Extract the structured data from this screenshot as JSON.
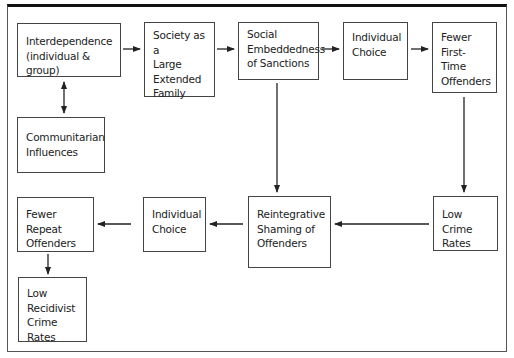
{
  "diagram": {
    "nodes": [
      {
        "id": "interdependence",
        "label": "Interdependence\n(individual & group)"
      },
      {
        "id": "society",
        "label": "Society as a\nLarge\nExtended\nFamily"
      },
      {
        "id": "social_embeddedness",
        "label": "Social\nEmbeddedness\nof Sanctions"
      },
      {
        "id": "individual_choice_top",
        "label": "Individual\nChoice"
      },
      {
        "id": "fewer_first_time",
        "label": "Fewer\nFirst-Time\nOffenders"
      },
      {
        "id": "communitarian",
        "label": "Communitarian\nInfluences"
      },
      {
        "id": "fewer_repeat",
        "label": "Fewer Repeat\nOffenders"
      },
      {
        "id": "individual_choice_bottom",
        "label": "Individual\nChoice"
      },
      {
        "id": "reintegrative",
        "label": "Reintegrative\nShaming of\nOffenders"
      },
      {
        "id": "low_crime",
        "label": "Low Crime\nRates"
      },
      {
        "id": "low_recidivist",
        "label": "Low\nRecidivist\nCrime Rates"
      }
    ],
    "edges": [
      {
        "from": "interdependence",
        "to": "society"
      },
      {
        "from": "society",
        "to": "social_embeddedness"
      },
      {
        "from": "social_embeddedness",
        "to": "individual_choice_top"
      },
      {
        "from": "individual_choice_top",
        "to": "fewer_first_time"
      },
      {
        "from": "interdependence",
        "to": "communitarian",
        "bidirectional": true
      },
      {
        "from": "social_embeddedness",
        "to": "reintegrative"
      },
      {
        "from": "fewer_first_time",
        "to": "low_crime"
      },
      {
        "from": "low_crime",
        "to": "reintegrative"
      },
      {
        "from": "reintegrative",
        "to": "individual_choice_bottom"
      },
      {
        "from": "individual_choice_bottom",
        "to": "fewer_repeat"
      },
      {
        "from": "fewer_repeat",
        "to": "low_recidivist"
      }
    ]
  }
}
